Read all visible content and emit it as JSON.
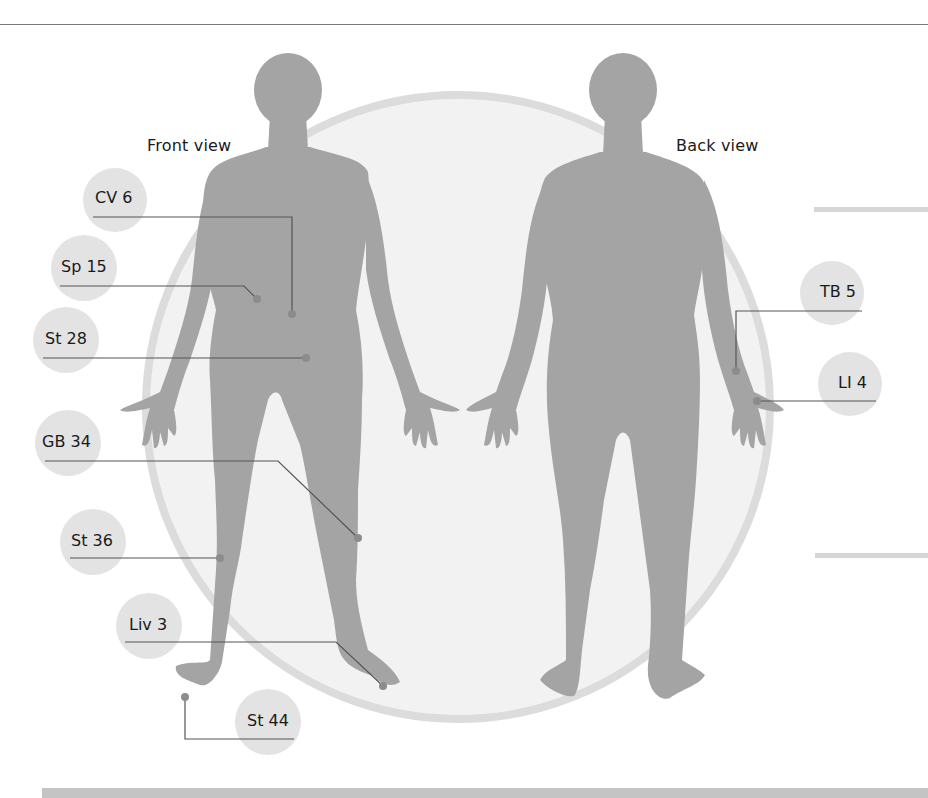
{
  "titles": {
    "front": "Front view",
    "back": "Back view"
  },
  "colors": {
    "silhouette": "#a3a3a3",
    "circle_fill": "#f1f1f1",
    "circle_ring": "#dddddd",
    "label_bubble": "#e2e2e2",
    "leader_line": "#555555",
    "point_dot": "#8a8a8a"
  },
  "points": [
    {
      "id": "CV 6",
      "label": "CV 6",
      "view": "front"
    },
    {
      "id": "Sp 15",
      "label": "Sp 15",
      "view": "front"
    },
    {
      "id": "St 28",
      "label": "St 28",
      "view": "front"
    },
    {
      "id": "GB 34",
      "label": "GB 34",
      "view": "front"
    },
    {
      "id": "St 36",
      "label": "St 36",
      "view": "front"
    },
    {
      "id": "Liv 3",
      "label": "Liv 3",
      "view": "front"
    },
    {
      "id": "St 44",
      "label": "St 44",
      "view": "front"
    },
    {
      "id": "TB 5",
      "label": "TB 5",
      "view": "back"
    },
    {
      "id": "LI 4",
      "label": "LI 4",
      "view": "back"
    }
  ]
}
